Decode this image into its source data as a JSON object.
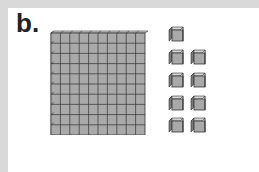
{
  "figure": {
    "label": "b.",
    "flat": {
      "rows": 10,
      "cols": 10,
      "value": 100
    },
    "units": {
      "count": 9,
      "value": 1
    },
    "colors": {
      "face": "#a9a9a9",
      "top": "#d4d4d4",
      "side": "#7a7a7a",
      "line": "#333333",
      "frame": "#d9d9d9"
    }
  }
}
